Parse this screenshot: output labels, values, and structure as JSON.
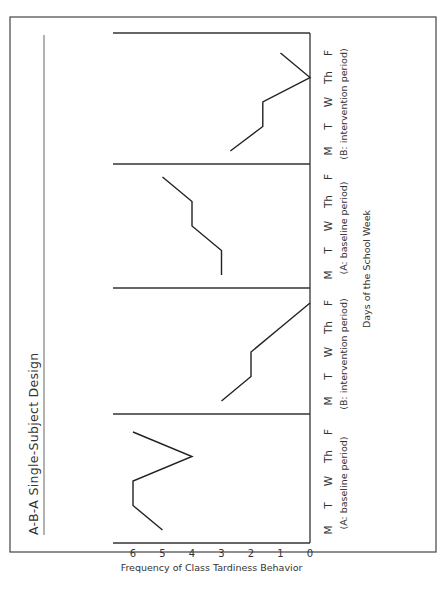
{
  "chart_data": {
    "type": "line",
    "title": "A-B-A Single-Subject Design",
    "xlabel": "Days of the School Week",
    "ylabel": "Frequency of Class Tardiness Behavior",
    "ylim": [
      0,
      6
    ],
    "yticks": [
      "0",
      "1",
      "2",
      "3",
      "4",
      "5",
      "6"
    ],
    "grid": false,
    "orientation": "rotated 90 degrees counter-clockwise",
    "phases": [
      {
        "label": "(A: baseline period)",
        "categories": [
          "M",
          "T",
          "W",
          "Th",
          "F"
        ],
        "values": [
          5,
          6,
          6,
          4,
          6
        ]
      },
      {
        "label": "(B: intervention period)",
        "categories": [
          "M",
          "T",
          "W",
          "Th",
          "F"
        ],
        "values": [
          3,
          2,
          2,
          1,
          0
        ]
      },
      {
        "label": "(A: baseline period)",
        "categories": [
          "M",
          "T",
          "W",
          "Th",
          "F"
        ],
        "values": [
          3,
          3,
          4,
          4,
          5
        ]
      },
      {
        "label": "(B: intervention period)",
        "categories": [
          "M",
          "T",
          "W",
          "Th",
          "F"
        ],
        "values": [
          2.7,
          1.6,
          1.6,
          0,
          1
        ]
      }
    ]
  }
}
